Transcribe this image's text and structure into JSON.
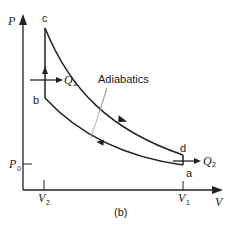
{
  "diagram": {
    "type": "PV diagram (Otto cycle)",
    "caption": "(b)",
    "axes": {
      "y_label": "P",
      "x_label": "V",
      "y_ticks": [
        {
          "label": "P",
          "sub": "0"
        }
      ],
      "x_ticks": [
        {
          "label": "V",
          "sub": "2"
        },
        {
          "label": "V",
          "sub": "1"
        }
      ]
    },
    "points": {
      "a": "a",
      "b": "b",
      "c": "c",
      "d": "d"
    },
    "heat": {
      "q1": {
        "label": "Q",
        "sub": "1"
      },
      "q2": {
        "label": "Q",
        "sub": "2"
      }
    },
    "annotation": "Adiabatics",
    "colors": {
      "line": "#222222",
      "pointer": "#999999",
      "background": "#ffffff"
    }
  }
}
